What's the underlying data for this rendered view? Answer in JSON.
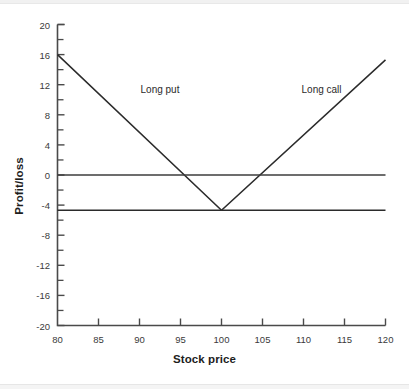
{
  "chart_data": {
    "type": "line",
    "title": "",
    "xlabel": "Stock price",
    "ylabel": "Profit/loss",
    "xlim": [
      80,
      120
    ],
    "ylim": [
      -20,
      20
    ],
    "grid": false,
    "legend_position": "inline-annotations",
    "xticks": [
      80,
      85,
      90,
      95,
      100,
      105,
      110,
      115,
      120
    ],
    "xtick_labels": [
      "80",
      "85",
      "90",
      "95",
      "100",
      "105",
      "110",
      "115",
      "120"
    ],
    "yticks": [
      20,
      16,
      12,
      8,
      4,
      0,
      -4,
      -8,
      -12,
      -16,
      -20
    ],
    "ytick_labels": [
      "20",
      "16",
      "12",
      "8",
      "4",
      "0",
      "-4",
      "-8",
      "-12",
      "-16",
      "-20"
    ],
    "y_minor_tick_interval": 2,
    "strike": 100,
    "premium": -4.7,
    "series": [
      {
        "name": "Long put",
        "label": "Long put",
        "label_x": 92.5,
        "label_y": 11.4,
        "color": "#2b2b2b",
        "points": [
          {
            "x": 80,
            "y": 16
          },
          {
            "x": 100,
            "y": -4.7
          },
          {
            "x": 120,
            "y": -4.7
          }
        ]
      },
      {
        "name": "Long call",
        "label": "Long call",
        "label_x": 112.2,
        "label_y": 11.4,
        "color": "#2b2b2b",
        "points": [
          {
            "x": 80,
            "y": -4.7
          },
          {
            "x": 100,
            "y": -4.7
          },
          {
            "x": 120,
            "y": 15.3
          }
        ]
      },
      {
        "name": "Zero line",
        "label": "",
        "color": "#3c3c3c",
        "points": [
          {
            "x": 80,
            "y": 0
          },
          {
            "x": 120,
            "y": 0
          }
        ]
      }
    ],
    "axis_color": "#4a4a4a",
    "background": "#ffffff"
  }
}
